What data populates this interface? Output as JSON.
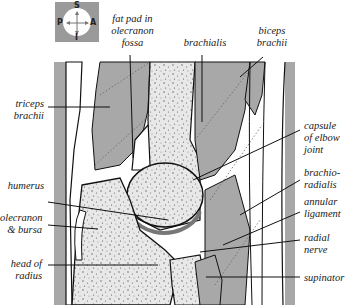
{
  "diagram": {
    "compass": {
      "top": "S",
      "bottom": "I",
      "left": "P",
      "right": "A"
    },
    "labels": {
      "fat_pad": [
        "fat pad in",
        "olecranon",
        "fossa"
      ],
      "brachialis": [
        "brachialis"
      ],
      "biceps_brachii": [
        "biceps",
        "brachii"
      ],
      "triceps_brachii": [
        "triceps",
        "brachii"
      ],
      "capsule_elbow_joint": [
        "capsule",
        "of elbow",
        "joint"
      ],
      "humerus": [
        "humerus"
      ],
      "brachioradialis": [
        "brachio-",
        "radialis"
      ],
      "olecranon_bursa": [
        "olecranon",
        "& bursa"
      ],
      "annular_ligament": [
        "annular",
        "ligament"
      ],
      "radial_nerve": [
        "radial",
        "nerve"
      ],
      "head_of_radius": [
        "head of",
        "radius"
      ],
      "supinator": [
        "supinator"
      ]
    },
    "colors": {
      "muscle": "#a8a8a8",
      "bone": "#e6e6e6",
      "bone_stipple": "#555555",
      "cartilage": "#8a8a8a",
      "outline": "#111111",
      "background": "#ffffff",
      "compass_bg": "#9a9a9a"
    }
  }
}
